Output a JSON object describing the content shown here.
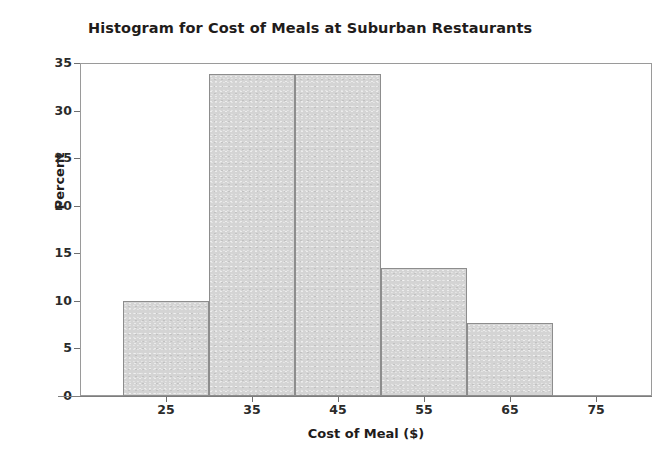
{
  "chart_data": {
    "type": "bar",
    "title": "Histogram for Cost of Meals at Suburban Restaurants",
    "xlabel": "Cost of Meal ($)",
    "ylabel": "Percent",
    "grid": false,
    "legend": null,
    "bin_width": 10,
    "bin_edges": [
      20,
      30,
      40,
      50,
      60,
      70
    ],
    "categories": [
      "20-30",
      "30-40",
      "40-50",
      "50-60",
      "60-70"
    ],
    "bin_centers": [
      25,
      35,
      45,
      55,
      65
    ],
    "values": [
      10.0,
      33.8,
      33.8,
      13.5,
      7.7
    ],
    "xlim": [
      15,
      81.5
    ],
    "ylim": [
      0,
      35
    ],
    "xticks": [
      25,
      35,
      45,
      55,
      65,
      75
    ],
    "xtick_labels": [
      "25",
      "35",
      "45",
      "55",
      "65",
      "75"
    ],
    "yticks": [
      0,
      5,
      10,
      15,
      20,
      25,
      30,
      35
    ],
    "ytick_labels": [
      "0",
      "5",
      "10",
      "15",
      "20",
      "25",
      "30",
      "35"
    ],
    "bar_fill_color": "#d4d4d4",
    "bar_edge_color": "#8d8d8d",
    "frame_color": "#9a9a9a",
    "text_color": "#1f1c1b",
    "background_color": "#ffffff"
  }
}
